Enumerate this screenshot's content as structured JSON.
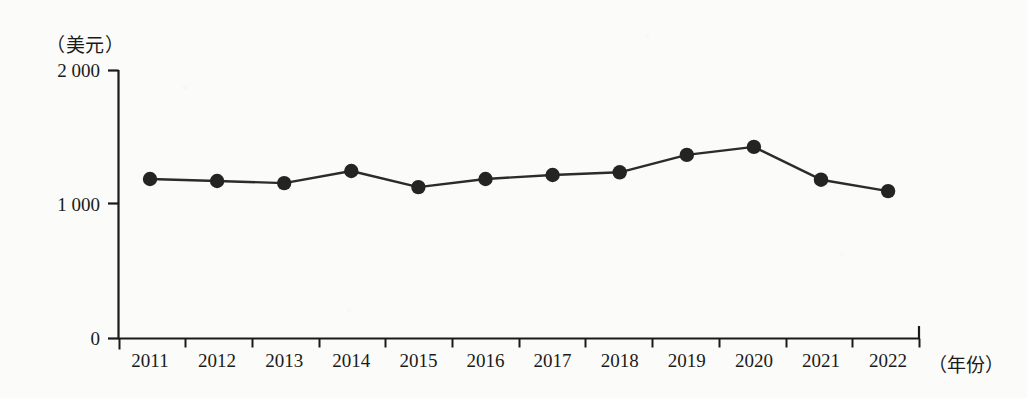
{
  "chart_data": {
    "type": "line",
    "title": "",
    "subtitle": "",
    "xlabel": "（年份）",
    "ylabel": "（美元）",
    "categories": [
      "2011",
      "2012",
      "2013",
      "2014",
      "2015",
      "2016",
      "2017",
      "2018",
      "2019",
      "2020",
      "2021",
      "2022"
    ],
    "values": [
      1190,
      1175,
      1160,
      1250,
      1130,
      1190,
      1220,
      1240,
      1370,
      1430,
      1185,
      1100
    ],
    "series": [
      {
        "name": "",
        "values": [
          1190,
          1175,
          1160,
          1250,
          1130,
          1190,
          1220,
          1240,
          1370,
          1430,
          1185,
          1100
        ]
      }
    ],
    "ylim": [
      0,
      2000
    ],
    "yticks": [
      0,
      1000,
      2000
    ],
    "ytick_labels": [
      "0",
      "1 000",
      "2 000"
    ],
    "grid": false,
    "legend": false,
    "legend_position": "none",
    "marker": "filled-circle",
    "line_color": "#2b2b2b",
    "marker_color": "#242424",
    "axis_color": "#1a1a1a",
    "background_color": "#fbfbf9"
  },
  "axes": {
    "y_unit_label": "（美元）",
    "x_axis_title": "（年份）",
    "y_tick_labels": [
      "2 000",
      "1 000",
      "0"
    ],
    "x_tick_labels": [
      "2011",
      "2012",
      "2013",
      "2014",
      "2015",
      "2016",
      "2017",
      "2018",
      "2019",
      "2020",
      "2021",
      "2022"
    ]
  }
}
